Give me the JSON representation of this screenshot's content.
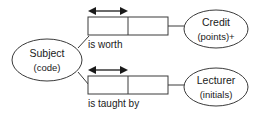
{
  "diagram": {
    "type": "orm-fact-type-diagram",
    "colors": {
      "background": "#ffffff",
      "stroke": "#3a3a3a",
      "text": "#1a1a1a",
      "constraint": "#1a1a1a"
    },
    "entities": [
      {
        "id": "subject",
        "name": "Subject",
        "reference_mode": "(code)",
        "shape": "ellipse",
        "cx": 47,
        "cy": 60,
        "rx": 35,
        "ry": 21
      },
      {
        "id": "credit",
        "name": "Credit",
        "reference_mode": "(points)+",
        "shape": "ellipse",
        "cx": 216,
        "cy": 29,
        "rx": 32,
        "ry": 19
      },
      {
        "id": "lecturer",
        "name": "Lecturer",
        "reference_mode": "(initials)",
        "shape": "ellipse",
        "cx": 216,
        "cy": 87,
        "rx": 32,
        "ry": 19
      }
    ],
    "fact_types": [
      {
        "id": "is-worth",
        "label": "is worth",
        "label_x": 88,
        "label_y": 44,
        "box_x": 88,
        "box_y": 17,
        "box_width": 80,
        "box_height": 18,
        "divider_x": 128,
        "roles": 2,
        "uniqueness": {
          "spans_role": 1,
          "x1": 89,
          "x2": 127,
          "y": 11,
          "arrowheads": "both"
        },
        "from_entity": "subject",
        "to_entity": "credit",
        "left_connector": {
          "x1": 78,
          "y1": 48,
          "x2": 88,
          "y2": 35
        },
        "right_connector": {
          "x1": 168,
          "y1": 26,
          "x2": 185,
          "y2": 26
        }
      },
      {
        "id": "is-taught-by",
        "label": "is taught by",
        "label_x": 88,
        "label_y": 104,
        "box_x": 88,
        "box_y": 76,
        "box_width": 80,
        "box_height": 18,
        "divider_x": 128,
        "roles": 2,
        "uniqueness": {
          "spans_role": 1,
          "x1": 89,
          "x2": 127,
          "y": 70,
          "arrowheads": "both"
        },
        "from_entity": "subject",
        "to_entity": "lecturer",
        "left_connector": {
          "x1": 78,
          "y1": 72,
          "x2": 88,
          "y2": 85
        },
        "right_connector": {
          "x1": 168,
          "y1": 85,
          "x2": 185,
          "y2": 85
        }
      }
    ]
  }
}
